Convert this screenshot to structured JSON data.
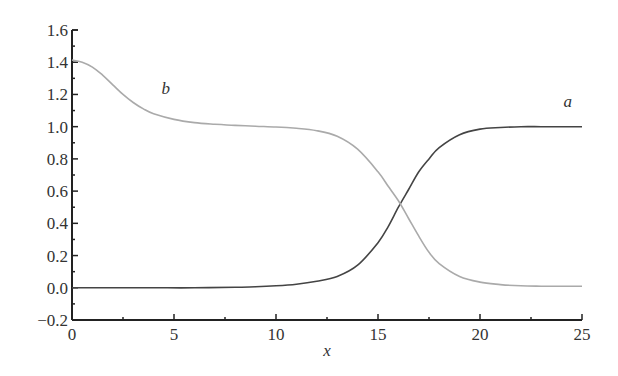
{
  "chart_data": {
    "type": "line",
    "title": "",
    "xlabel": "x",
    "ylabel": "",
    "xlim": [
      0,
      25
    ],
    "ylim": [
      -0.2,
      1.6
    ],
    "x_ticks": [
      0,
      5,
      10,
      15,
      20,
      25
    ],
    "x_tick_labels": [
      "0",
      "5",
      "10",
      "15",
      "20",
      "25"
    ],
    "y_ticks": [
      -0.2,
      0.0,
      0.2,
      0.4,
      0.6,
      0.8,
      1.0,
      1.2,
      1.4,
      1.6
    ],
    "y_tick_labels": [
      "−0.2",
      "0.0",
      "0.2",
      "0.4",
      "0.6",
      "0.8",
      "1.0",
      "1.2",
      "1.4",
      "1.6"
    ],
    "grid": false,
    "legend": "none (inline curve labels)",
    "series": [
      {
        "name": "a",
        "color": "#444444",
        "label_pos": [
          24.3,
          1.12
        ],
        "x": [
          0,
          2,
          4,
          6,
          8,
          9,
          10,
          11,
          12,
          13,
          14,
          15,
          15.5,
          16,
          16.5,
          17,
          17.5,
          18,
          19,
          20,
          21,
          22,
          23,
          24,
          25
        ],
        "y": [
          0.0,
          0.0,
          0.0,
          0.0,
          0.003,
          0.006,
          0.012,
          0.022,
          0.04,
          0.07,
          0.14,
          0.28,
          0.38,
          0.5,
          0.61,
          0.72,
          0.8,
          0.87,
          0.95,
          0.985,
          0.995,
          1.0,
          1.0,
          1.0,
          1.0
        ]
      },
      {
        "name": "b",
        "color": "#aaaaaa",
        "label_pos": [
          4.6,
          1.2
        ],
        "x": [
          0,
          0.5,
          1,
          1.5,
          2,
          2.5,
          3,
          3.5,
          4,
          5,
          6,
          7,
          8,
          9,
          10,
          11,
          12,
          13,
          14,
          15,
          15.5,
          16,
          16.5,
          17,
          17.5,
          18,
          19,
          20,
          21,
          22,
          23,
          24,
          25
        ],
        "y": [
          1.414,
          1.4,
          1.37,
          1.32,
          1.26,
          1.2,
          1.15,
          1.11,
          1.08,
          1.045,
          1.025,
          1.015,
          1.008,
          1.003,
          0.998,
          0.99,
          0.975,
          0.94,
          0.86,
          0.72,
          0.63,
          0.54,
          0.43,
          0.32,
          0.22,
          0.15,
          0.07,
          0.035,
          0.02,
          0.012,
          0.01,
          0.01,
          0.01
        ]
      }
    ]
  },
  "plot_area": {
    "left": 72,
    "right": 582,
    "top": 30,
    "bottom": 320
  }
}
